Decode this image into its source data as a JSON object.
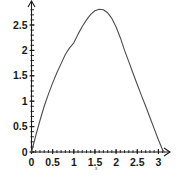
{
  "chart_data": {
    "type": "line",
    "title": "",
    "subtitle": "",
    "xlabel": "x",
    "ylabel": "",
    "xlim": [
      0,
      3.25
    ],
    "ylim": [
      0,
      2.95
    ],
    "grid": false,
    "legend": null,
    "x_ticks": [
      {
        "value": 0,
        "label": "0"
      },
      {
        "value": 0.5,
        "label": "0.5"
      },
      {
        "value": 1,
        "label": "1"
      },
      {
        "value": 1.5,
        "label": "1.5"
      },
      {
        "value": 2,
        "label": "2"
      },
      {
        "value": 2.5,
        "label": "2.5"
      },
      {
        "value": 3,
        "label": "3"
      }
    ],
    "y_ticks": [
      {
        "value": 0,
        "label": "0"
      },
      {
        "value": 0.5,
        "label": "0.5"
      },
      {
        "value": 1,
        "label": "1"
      },
      {
        "value": 1.5,
        "label": "1.5"
      },
      {
        "value": 2,
        "label": "2"
      },
      {
        "value": 2.5,
        "label": "2.5"
      }
    ],
    "x_minor_tick_step": 0.1,
    "y_minor_tick_step": 0.1,
    "series": [
      {
        "name": "curve",
        "color": "#4d4d4d",
        "x": [
          0.0,
          0.1,
          0.2,
          0.3,
          0.4,
          0.5,
          0.6,
          0.7,
          0.8,
          0.9,
          1.0,
          1.1,
          1.2,
          1.3,
          1.4,
          1.5,
          1.6,
          1.7,
          1.8,
          1.9,
          2.0,
          2.1,
          2.2,
          2.3,
          2.4,
          2.5,
          2.6,
          2.7,
          2.8,
          2.9,
          3.0,
          3.1,
          3.1416
        ],
        "y": [
          0.0,
          0.32,
          0.62,
          0.9,
          1.14,
          1.36,
          1.56,
          1.74,
          1.92,
          2.05,
          2.15,
          2.32,
          2.47,
          2.6,
          2.71,
          2.78,
          2.81,
          2.8,
          2.74,
          2.63,
          2.46,
          2.25,
          2.0,
          1.78,
          1.55,
          1.33,
          1.11,
          0.9,
          0.68,
          0.46,
          0.24,
          0.04,
          0.0
        ]
      }
    ],
    "axis_arrows": true,
    "axis_color": "#1a1a1a",
    "plot_background": "#ffffff"
  },
  "labels": {
    "x_axis_name": "x"
  }
}
